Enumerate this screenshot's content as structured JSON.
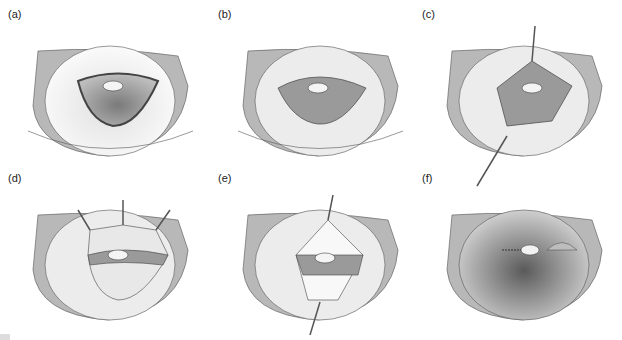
{
  "figure": {
    "panels": [
      {
        "id": "a",
        "label": "(a)",
        "stage": "outlined-flap"
      },
      {
        "id": "b",
        "label": "(b)",
        "stage": "textured-flap"
      },
      {
        "id": "c",
        "label": "(c)",
        "stage": "single-retractor-lift"
      },
      {
        "id": "d",
        "label": "(d)",
        "stage": "triple-retractor-exposure"
      },
      {
        "id": "e",
        "label": "(e)",
        "stage": "retractor-with-pale-lower-area"
      },
      {
        "id": "f",
        "label": "(f)",
        "stage": "closed-with-scar"
      }
    ],
    "colors": {
      "outline": "#444444",
      "rim": "#9a9a9a",
      "interior": "#c8c8c8",
      "flap": "#8e8e8e",
      "disc": "#f4f4f4"
    }
  }
}
